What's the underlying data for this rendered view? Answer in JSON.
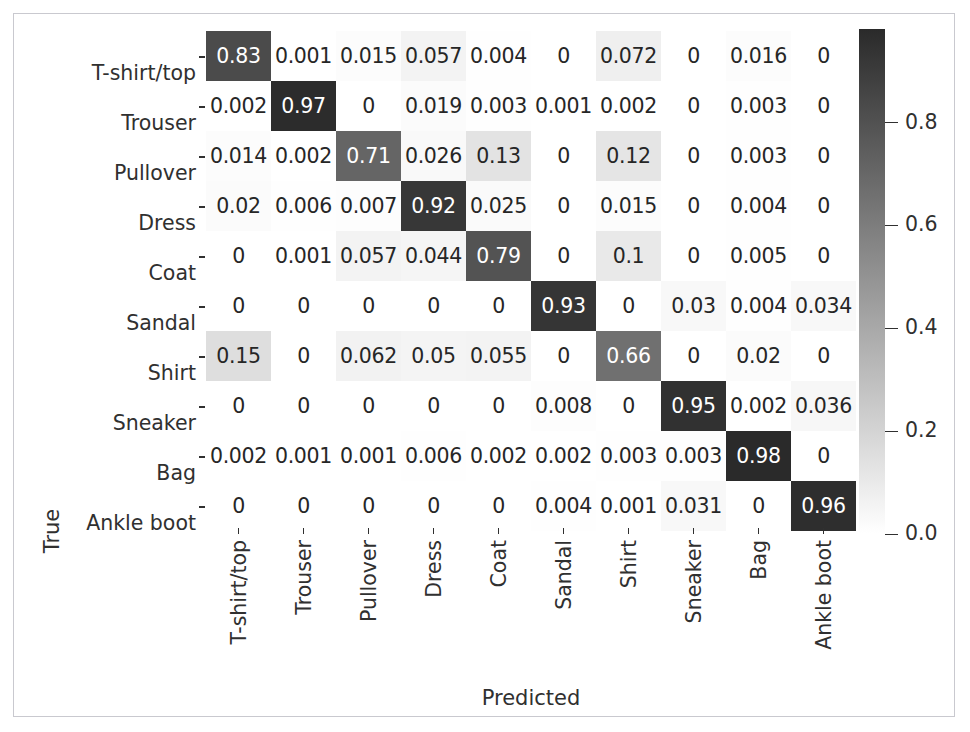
{
  "chart_data": {
    "type": "heatmap",
    "title": "",
    "xlabel": "Predicted",
    "ylabel": "True",
    "categories": [
      "T-shirt/top",
      "Trouser",
      "Pullover",
      "Dress",
      "Coat",
      "Sandal",
      "Shirt",
      "Sneaker",
      "Bag",
      "Ankle boot"
    ],
    "x_tick_labels": [
      "T-shirt/top",
      "Trouser",
      "Pullover",
      "Dress",
      "Coat",
      "Sandal",
      "Shirt",
      "Sneaker",
      "Bag",
      "Ankle boot"
    ],
    "y_tick_labels": [
      "T-shirt/top",
      "Trouser",
      "Pullover",
      "Dress",
      "Coat",
      "Sandal",
      "Shirt",
      "Sneaker",
      "Bag",
      "Ankle boot"
    ],
    "grid": false,
    "colormap": "gray_reversed",
    "colorbar": {
      "position": "right",
      "ticks": [
        0.8,
        0.6,
        0.4,
        0.2,
        0.0
      ],
      "tick_labels": [
        "0.8",
        "0.6",
        "0.4",
        "0.2",
        "0.0"
      ],
      "vmin": 0.0,
      "vmax": 0.98
    },
    "matrix": [
      [
        0.83,
        0.001,
        0.015,
        0.057,
        0.004,
        0,
        0.072,
        0,
        0.016,
        0
      ],
      [
        0.002,
        0.97,
        0,
        0.019,
        0.003,
        0.001,
        0.002,
        0,
        0.003,
        0
      ],
      [
        0.014,
        0.002,
        0.71,
        0.026,
        0.13,
        0,
        0.12,
        0,
        0.003,
        0
      ],
      [
        0.02,
        0.006,
        0.007,
        0.92,
        0.025,
        0,
        0.015,
        0,
        0.004,
        0
      ],
      [
        0,
        0.001,
        0.057,
        0.044,
        0.79,
        0,
        0.1,
        0,
        0.005,
        0
      ],
      [
        0,
        0,
        0,
        0,
        0,
        0.93,
        0,
        0.03,
        0.004,
        0.034
      ],
      [
        0.15,
        0,
        0.062,
        0.05,
        0.055,
        0,
        0.66,
        0,
        0.02,
        0
      ],
      [
        0,
        0,
        0,
        0,
        0,
        0.008,
        0,
        0.95,
        0.002,
        0.036
      ],
      [
        0.002,
        0.001,
        0.001,
        0.006,
        0.002,
        0.002,
        0.003,
        0.003,
        0.98,
        0
      ],
      [
        0,
        0,
        0,
        0,
        0,
        0.004,
        0.001,
        0.031,
        0,
        0.96
      ]
    ],
    "cell_labels": [
      [
        "0.83",
        "0.001",
        "0.015",
        "0.057",
        "0.004",
        "0",
        "0.072",
        "0",
        "0.016",
        "0"
      ],
      [
        "0.002",
        "0.97",
        "0",
        "0.019",
        "0.003",
        "0.001",
        "0.002",
        "0",
        "0.003",
        "0"
      ],
      [
        "0.014",
        "0.002",
        "0.71",
        "0.026",
        "0.13",
        "0",
        "0.12",
        "0",
        "0.003",
        "0"
      ],
      [
        "0.02",
        "0.006",
        "0.007",
        "0.92",
        "0.025",
        "0",
        "0.015",
        "0",
        "0.004",
        "0"
      ],
      [
        "0",
        "0.001",
        "0.057",
        "0.044",
        "0.79",
        "0",
        "0.1",
        "0",
        "0.005",
        "0"
      ],
      [
        "0",
        "0",
        "0",
        "0",
        "0",
        "0.93",
        "0",
        "0.03",
        "0.004",
        "0.034"
      ],
      [
        "0.15",
        "0",
        "0.062",
        "0.05",
        "0.055",
        "0",
        "0.66",
        "0",
        "0.02",
        "0"
      ],
      [
        "0",
        "0",
        "0",
        "0",
        "0",
        "0.008",
        "0",
        "0.95",
        "0.002",
        "0.036"
      ],
      [
        "0.002",
        "0.001",
        "0.001",
        "0.006",
        "0.002",
        "0.002",
        "0.003",
        "0.003",
        "0.98",
        "0"
      ],
      [
        "0",
        "0",
        "0",
        "0",
        "0",
        "0.004",
        "0.001",
        "0.031",
        "0",
        "0.96"
      ]
    ]
  },
  "colors": {
    "text": "#303030",
    "cell_text_light": "#ffffff",
    "frame": "#c9c9cf",
    "background": "#ffffff"
  }
}
